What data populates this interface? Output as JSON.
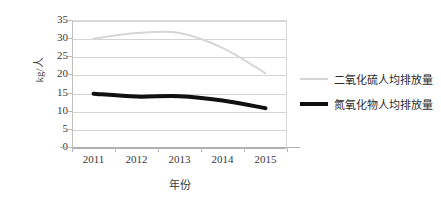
{
  "chart_data": {
    "type": "line",
    "title": "",
    "xlabel": "年份",
    "ylabel": "kg/人",
    "categories": [
      "2011",
      "2012",
      "2013",
      "2014",
      "2015"
    ],
    "x": [
      2011,
      2012,
      2013,
      2014,
      2015
    ],
    "ylim": [
      0,
      35
    ],
    "yticks": [
      "0",
      "5",
      "10",
      "15",
      "20",
      "25",
      "30",
      "35"
    ],
    "ytick_values": [
      0,
      5,
      10,
      15,
      20,
      25,
      30,
      35
    ],
    "grid": true,
    "legend_position": "right",
    "series": [
      {
        "name": "二氧化硫人均排放量",
        "color": "#d6d6d6",
        "line_width": 2,
        "values": [
          29.8,
          31.4,
          31.4,
          27.3,
          20.3
        ]
      },
      {
        "name": "氮氧化物人均排放量",
        "color": "#101010",
        "line_width": 4,
        "values": [
          14.7,
          13.9,
          14.0,
          12.8,
          10.7
        ]
      }
    ]
  },
  "legend": {
    "items": [
      {
        "label": "二氧化硫人均排放量",
        "swatch": "so2"
      },
      {
        "label": "氮氧化物人均排放量",
        "swatch": "nox"
      }
    ]
  }
}
